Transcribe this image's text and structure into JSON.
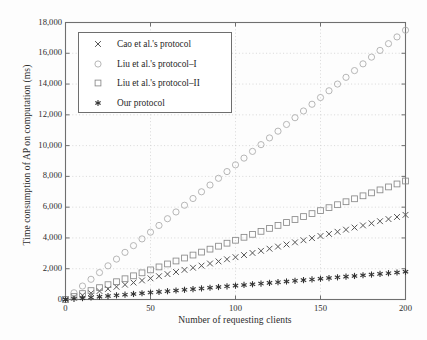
{
  "chart_data": {
    "type": "scatter",
    "title": "",
    "xlabel": "Number of requesting clients",
    "ylabel": "Time consumption of AP on computation (ms)",
    "xlim": [
      0,
      200
    ],
    "ylim": [
      0,
      18000
    ],
    "xticks": [
      0,
      50,
      100,
      150,
      200
    ],
    "xtick_labels": [
      "0",
      "50",
      "100",
      "150",
      "200"
    ],
    "yticks": [
      0,
      2000,
      4000,
      6000,
      8000,
      10000,
      12000,
      14000,
      16000,
      18000
    ],
    "ytick_labels": [
      "0",
      "2,000",
      "4,000",
      "6,000",
      "8,000",
      "10,000",
      "12,000",
      "14,000",
      "16,000",
      "18,000"
    ],
    "grid": true,
    "grid_style": "dotted",
    "legend_position": "upper-left-inside",
    "x": [
      0,
      5,
      10,
      15,
      20,
      25,
      30,
      35,
      40,
      45,
      50,
      55,
      60,
      65,
      70,
      75,
      80,
      85,
      90,
      95,
      100,
      105,
      110,
      115,
      120,
      125,
      130,
      135,
      140,
      145,
      150,
      155,
      160,
      165,
      170,
      175,
      180,
      185,
      190,
      195,
      200
    ],
    "series": [
      {
        "name": "Cao et al.'s protocol",
        "marker": "x",
        "color": "#555555",
        "values": [
          0,
          138,
          275,
          413,
          550,
          688,
          825,
          963,
          1100,
          1238,
          1375,
          1513,
          1650,
          1788,
          1925,
          2063,
          2200,
          2338,
          2475,
          2613,
          2750,
          2888,
          3025,
          3163,
          3300,
          3438,
          3575,
          3713,
          3850,
          3988,
          4125,
          4263,
          4400,
          4538,
          4675,
          4813,
          4950,
          5088,
          5225,
          5363,
          5500
        ]
      },
      {
        "name": "Liu et al.'s protocol-I",
        "marker": "circle",
        "color": "#aaaaaa",
        "values": [
          0,
          438,
          875,
          1313,
          1750,
          2188,
          2625,
          3063,
          3500,
          3938,
          4375,
          4813,
          5250,
          5688,
          6125,
          6563,
          7000,
          7438,
          7875,
          8313,
          8750,
          9188,
          9625,
          10063,
          10500,
          10938,
          11375,
          11813,
          12250,
          12688,
          13125,
          13563,
          14000,
          14438,
          14875,
          15313,
          15750,
          16188,
          16625,
          17063,
          17500
        ]
      },
      {
        "name": "Liu et al.'s protocol-II",
        "marker": "square",
        "color": "#888888",
        "values": [
          0,
          193,
          385,
          578,
          770,
          963,
          1155,
          1348,
          1540,
          1733,
          1925,
          2118,
          2310,
          2503,
          2695,
          2888,
          3080,
          3273,
          3465,
          3658,
          3850,
          4043,
          4235,
          4428,
          4620,
          4813,
          5005,
          5198,
          5390,
          5583,
          5775,
          5968,
          6160,
          6353,
          6545,
          6738,
          6930,
          7123,
          7315,
          7508,
          7700
        ]
      },
      {
        "name": "Our protocol",
        "marker": "asterisk",
        "color": "#333333",
        "values": [
          0,
          45,
          90,
          135,
          180,
          225,
          270,
          315,
          360,
          405,
          450,
          495,
          540,
          585,
          630,
          675,
          720,
          765,
          810,
          855,
          900,
          945,
          990,
          1035,
          1080,
          1125,
          1170,
          1215,
          1260,
          1305,
          1350,
          1395,
          1440,
          1485,
          1530,
          1575,
          1620,
          1665,
          1710,
          1755,
          1800
        ]
      }
    ]
  },
  "legend": {
    "entries": [
      {
        "label": "Cao et al.'s protocol",
        "marker": "x"
      },
      {
        "label": "Liu et al.'s protocol–I",
        "marker": "circle"
      },
      {
        "label": "Liu et al.'s protocol–II",
        "marker": "square"
      },
      {
        "label": "Our protocol",
        "marker": "asterisk"
      }
    ]
  }
}
